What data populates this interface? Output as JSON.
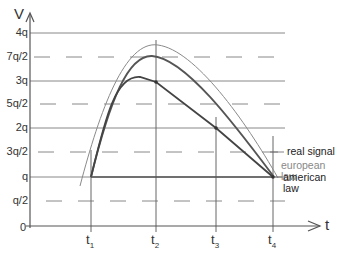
{
  "axes": {
    "y_label": "V",
    "x_label": "t",
    "y_ticks": [
      {
        "label": "4q",
        "y": 33,
        "style": "solid"
      },
      {
        "label": "7q/2",
        "y": 57,
        "style": "dashed"
      },
      {
        "label": "3q",
        "y": 81,
        "style": "solid"
      },
      {
        "label": "5q/2",
        "y": 104,
        "style": "dashed"
      },
      {
        "label": "2q",
        "y": 128,
        "style": "solid"
      },
      {
        "label": "3q/2",
        "y": 152,
        "style": "dashed"
      },
      {
        "label": "q",
        "y": 177,
        "style": "solid"
      },
      {
        "label": "q/2",
        "y": 201,
        "style": "dashed"
      },
      {
        "label": "0",
        "y": 226,
        "style": "axis"
      }
    ],
    "x_ticks": [
      {
        "label": "t",
        "sub": "1",
        "x": 91
      },
      {
        "label": "t",
        "sub": "2",
        "x": 156
      },
      {
        "label": "t",
        "sub": "3",
        "x": 216
      },
      {
        "label": "t",
        "sub": "4",
        "x": 273
      }
    ]
  },
  "legend": {
    "real_signal": "real signal",
    "european_law": "european law",
    "american_law": "american law"
  },
  "colors": {
    "axis": "#666666",
    "grid": "#777777",
    "real_signal": "#888888",
    "european_law": "#555555",
    "american_law": "#444444",
    "european_text": "#888888"
  }
}
